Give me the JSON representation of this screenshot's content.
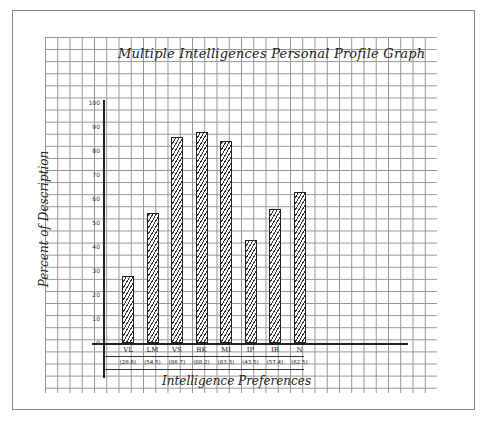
{
  "chart_data": {
    "type": "bar",
    "title": "Multiple Intelligences Personal Profile Graph",
    "xlabel": "Intelligence Preferences",
    "ylabel": "Percent of Description",
    "ylim": [
      0,
      100
    ],
    "yticks": [
      0,
      10,
      20,
      30,
      40,
      50,
      60,
      70,
      80,
      90,
      100
    ],
    "grid": true,
    "legend": null,
    "categories": [
      "VL",
      "LM",
      "VS",
      "BK",
      "MI",
      "IP",
      "IR",
      "N"
    ],
    "values": [
      28,
      54,
      86,
      88,
      84,
      43,
      56,
      63
    ],
    "value_labels": [
      "(28.6)",
      "(54.5)",
      "(86.7)",
      "(88.2)",
      "(83.3)",
      "(43.5)",
      "(57.4)",
      "(62.5)"
    ]
  },
  "labels": {
    "title": "Multiple Intelligences Personal Profile Graph",
    "xlabel": "Intelligence Preferences",
    "ylabel": "Percent of Description"
  }
}
